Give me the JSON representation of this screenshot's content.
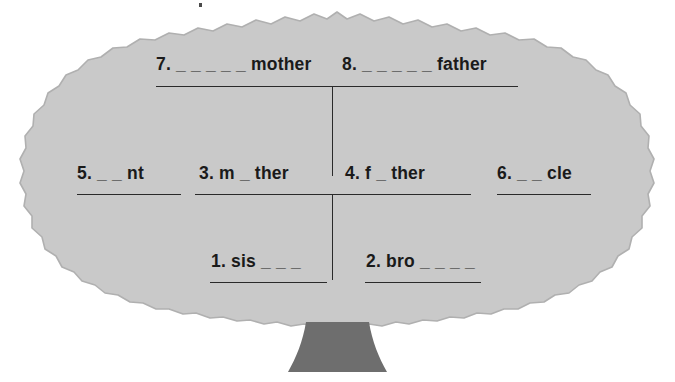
{
  "worksheet": {
    "title": "Family Tree Fill-in-the-Blank Worksheet",
    "type": "family-tree-vocabulary-exercise",
    "canvas": {
      "width": 675,
      "height": 382
    }
  },
  "colors": {
    "page_background": "#ffffff",
    "canopy_fill": "#c9c9c9",
    "canopy_outline": "#b3b3b3",
    "trunk_fill": "#6e6e6e",
    "text": "#1a1a1a",
    "rule_line": "#2a2a2a"
  },
  "tree": {
    "canopy_name": "tree-canopy",
    "trunk_name": "tree-trunk"
  },
  "blanks": [
    {
      "id": "blank-7",
      "number": "7.",
      "text": "7. _ _ _ _ _ mother",
      "prefix_dashes": 5,
      "word_fragment": "mother",
      "row": "grandparents",
      "position": "left"
    },
    {
      "id": "blank-8",
      "number": "8.",
      "text": "8. _ _ _ _ _ father",
      "prefix_dashes": 5,
      "word_fragment": "father",
      "row": "grandparents",
      "position": "right"
    },
    {
      "id": "blank-5",
      "number": "5.",
      "text": "5. _ _ nt",
      "prefix_dashes": 2,
      "word_fragment": "nt",
      "row": "parents",
      "position": "far-left"
    },
    {
      "id": "blank-3",
      "number": "3.",
      "text": "3. m _ ther",
      "prefix_dashes": 1,
      "word_fragment": "m_ther",
      "row": "parents",
      "position": "center-left"
    },
    {
      "id": "blank-4",
      "number": "4.",
      "text": "4. f _ ther",
      "prefix_dashes": 1,
      "word_fragment": "f_ther",
      "row": "parents",
      "position": "center-right"
    },
    {
      "id": "blank-6",
      "number": "6.",
      "text": "6. _ _ cle",
      "prefix_dashes": 2,
      "word_fragment": "cle",
      "row": "parents",
      "position": "far-right"
    },
    {
      "id": "blank-1",
      "number": "1.",
      "text": "1. sis _ _ _",
      "prefix_dashes": 0,
      "word_fragment": "sis",
      "row": "children",
      "position": "left"
    },
    {
      "id": "blank-2",
      "number": "2.",
      "text": "2. bro _ _ _ _",
      "prefix_dashes": 0,
      "word_fragment": "bro",
      "row": "children",
      "position": "right"
    }
  ]
}
